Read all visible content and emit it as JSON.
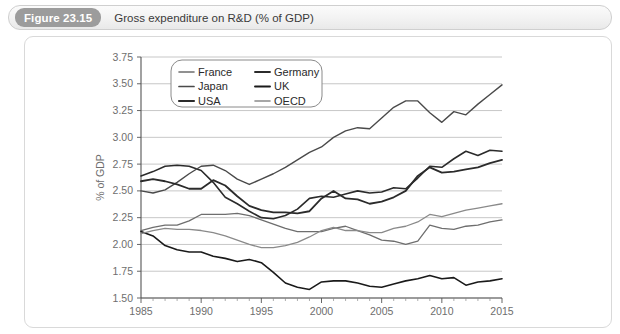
{
  "figure": {
    "badge": "Figure 23.15",
    "caption": "Gross expenditure on R&D (% of GDP)"
  },
  "chart_data": {
    "type": "line",
    "title": "Gross expenditure on R&D (% of GDP)",
    "xlabel": "",
    "ylabel": "% of GDP",
    "xlim": [
      1985,
      2015
    ],
    "ylim": [
      1.5,
      3.75
    ],
    "xticks": [
      1985,
      1990,
      1995,
      2000,
      2005,
      2010,
      2015
    ],
    "yticks": [
      1.5,
      1.75,
      2.0,
      2.25,
      2.5,
      2.75,
      3.0,
      3.25,
      3.5,
      3.75
    ],
    "ytick_labels": [
      "1.50",
      "1.75",
      "2.00",
      "2.25",
      "2.50",
      "2.75",
      "3.00",
      "3.25",
      "3.50",
      "3.75"
    ],
    "xtick_labels": [
      "1985",
      "1990",
      "1995",
      "2000",
      "2005",
      "2010",
      "2015"
    ],
    "grid": "horizontal",
    "legend_position": "top-left-inside",
    "legend_columns": 2,
    "x": [
      1985,
      1986,
      1987,
      1988,
      1989,
      1990,
      1991,
      1992,
      1993,
      1994,
      1995,
      1996,
      1997,
      1998,
      1999,
      2000,
      2001,
      2002,
      2003,
      2004,
      2005,
      2006,
      2007,
      2008,
      2009,
      2010,
      2011,
      2012,
      2013,
      2014,
      2015
    ],
    "series": [
      {
        "name": "France",
        "color": "#6e6e6e",
        "width": 1.3,
        "values": [
          2.13,
          2.16,
          2.18,
          2.18,
          2.22,
          2.28,
          2.28,
          2.28,
          2.29,
          2.27,
          2.23,
          2.19,
          2.15,
          2.12,
          2.12,
          2.12,
          2.15,
          2.17,
          2.13,
          2.09,
          2.04,
          2.03,
          2.0,
          2.03,
          2.18,
          2.15,
          2.14,
          2.17,
          2.18,
          2.21,
          2.23
        ]
      },
      {
        "name": "Germany",
        "color": "#2b2b2b",
        "width": 1.6,
        "values": [
          2.64,
          2.68,
          2.73,
          2.74,
          2.73,
          2.69,
          2.58,
          2.44,
          2.38,
          2.31,
          2.25,
          2.24,
          2.27,
          2.33,
          2.43,
          2.45,
          2.44,
          2.47,
          2.5,
          2.48,
          2.49,
          2.53,
          2.52,
          2.62,
          2.73,
          2.72,
          2.8,
          2.87,
          2.83,
          2.88,
          2.87
        ]
      },
      {
        "name": "Japan",
        "color": "#4a4a4a",
        "width": 1.4,
        "values": [
          2.5,
          2.48,
          2.51,
          2.58,
          2.66,
          2.73,
          2.74,
          2.69,
          2.61,
          2.56,
          2.61,
          2.66,
          2.72,
          2.79,
          2.86,
          2.91,
          3.0,
          3.06,
          3.09,
          3.08,
          3.18,
          3.28,
          3.34,
          3.34,
          3.23,
          3.14,
          3.24,
          3.21,
          3.31,
          3.4,
          3.49
        ]
      },
      {
        "name": "UK",
        "color": "#1a1a1a",
        "width": 1.6,
        "values": [
          2.12,
          2.08,
          1.99,
          1.95,
          1.93,
          1.93,
          1.89,
          1.87,
          1.84,
          1.86,
          1.83,
          1.74,
          1.64,
          1.6,
          1.58,
          1.65,
          1.66,
          1.66,
          1.64,
          1.61,
          1.6,
          1.63,
          1.66,
          1.68,
          1.71,
          1.68,
          1.69,
          1.62,
          1.65,
          1.66,
          1.68
        ]
      },
      {
        "name": "USA",
        "color": "#2b2b2b",
        "width": 1.8,
        "values": [
          2.59,
          2.61,
          2.59,
          2.56,
          2.52,
          2.52,
          2.6,
          2.55,
          2.45,
          2.36,
          2.32,
          2.3,
          2.3,
          2.29,
          2.31,
          2.43,
          2.5,
          2.43,
          2.42,
          2.38,
          2.4,
          2.44,
          2.5,
          2.64,
          2.72,
          2.67,
          2.68,
          2.7,
          2.72,
          2.76,
          2.79
        ]
      },
      {
        "name": "OECD",
        "color": "#8a8a8a",
        "width": 1.3,
        "values": [
          2.1,
          2.13,
          2.15,
          2.14,
          2.14,
          2.13,
          2.11,
          2.08,
          2.04,
          2.0,
          1.97,
          1.97,
          1.99,
          2.02,
          2.07,
          2.13,
          2.16,
          2.13,
          2.13,
          2.11,
          2.11,
          2.15,
          2.17,
          2.21,
          2.28,
          2.26,
          2.29,
          2.32,
          2.34,
          2.36,
          2.38
        ]
      }
    ]
  }
}
